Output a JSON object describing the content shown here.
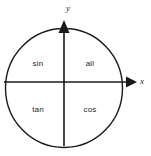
{
  "diagram": {
    "background_color": "#ffffff",
    "stroke_color": "#1a1a1a",
    "text_color": "#231f20",
    "circle": {
      "center_x": 64,
      "center_y": 88,
      "radius_x": 58.5,
      "radius_y": 59.5
    },
    "axes": {
      "origin_x": 64,
      "origin_y": 82,
      "x_axis": {
        "label": "x",
        "label_x": 142,
        "label_y": 82,
        "start_x": 4,
        "end_x": 133,
        "arrow_tip_x": 136
      },
      "y_axis": {
        "label": "y",
        "label_x": 68,
        "label_y": 9,
        "start_y": 146,
        "end_y": 25,
        "arrow_tip_y": 21
      }
    },
    "quadrants": [
      {
        "name": "quadrant-2",
        "label": "sin",
        "x": 38,
        "y": 64
      },
      {
        "name": "quadrant-1",
        "label": "all",
        "x": 90,
        "y": 64
      },
      {
        "name": "quadrant-3",
        "label": "tan",
        "x": 38,
        "y": 110
      },
      {
        "name": "quadrant-4",
        "label": "cos",
        "x": 90,
        "y": 110
      }
    ]
  }
}
